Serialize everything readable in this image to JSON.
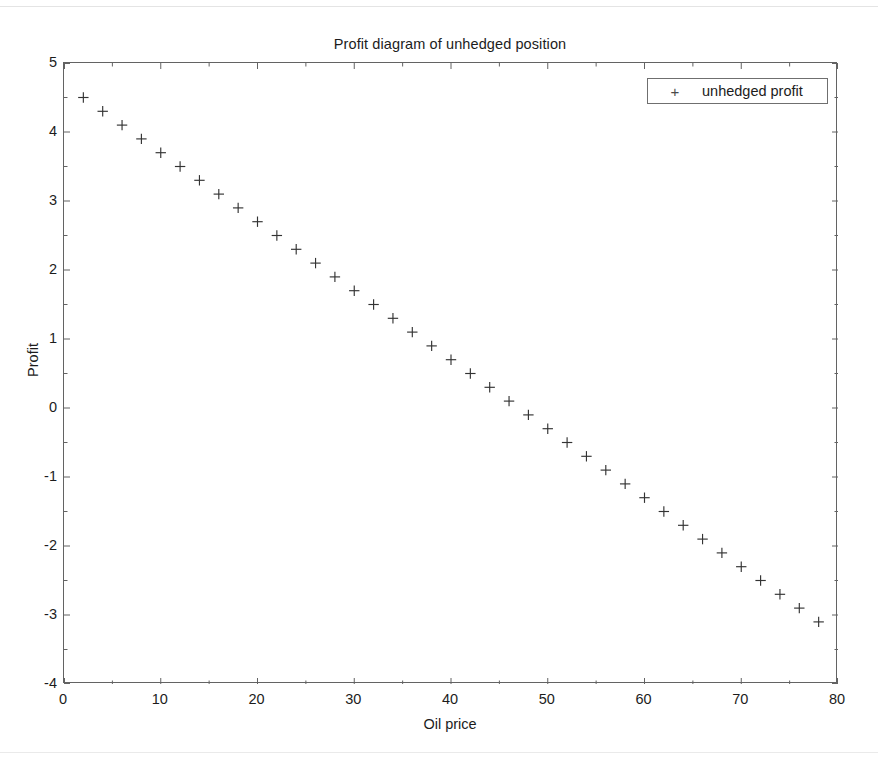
{
  "chart_data": {
    "type": "scatter",
    "title": "Profit diagram of unhedged position",
    "xlabel": "Oil price",
    "ylabel": "Profit",
    "xlim": [
      0,
      80
    ],
    "ylim": [
      -4,
      5
    ],
    "grid": false,
    "legend_position": "top-right",
    "marker": "+",
    "marker_color": "#333333",
    "series": [
      {
        "name": "unhedged profit",
        "marker": "+",
        "x": [
          2,
          4,
          6,
          8,
          10,
          12,
          14,
          16,
          18,
          20,
          22,
          24,
          26,
          28,
          30,
          32,
          34,
          36,
          38,
          40,
          42,
          44,
          46,
          48,
          50,
          52,
          54,
          56,
          58,
          60,
          62,
          64,
          66,
          68,
          70,
          72,
          74,
          76,
          78
        ],
        "values": [
          4.5,
          4.3,
          4.1,
          3.9,
          3.7,
          3.5,
          3.3,
          3.1,
          2.9,
          2.7,
          2.5,
          2.3,
          2.1,
          1.9,
          1.7,
          1.5,
          1.3,
          1.1,
          0.9,
          0.7,
          0.5,
          0.3,
          0.1,
          -0.1,
          -0.3,
          -0.5,
          -0.7,
          -0.9,
          -1.1,
          -1.3,
          -1.5,
          -1.7,
          -1.9,
          -2.1,
          -2.3,
          -2.5,
          -2.7,
          -2.9,
          -3.1
        ]
      }
    ],
    "xticks": [
      0,
      10,
      20,
      30,
      40,
      50,
      60,
      70,
      80
    ],
    "xtick_labels": [
      "0",
      "10",
      "20",
      "30",
      "40",
      "50",
      "60",
      "70",
      "80"
    ],
    "xminor_ticks": [
      5,
      15,
      25,
      35,
      45,
      55,
      65,
      75
    ],
    "yticks": [
      5,
      4,
      3,
      2,
      1,
      0,
      -1,
      -2,
      -3,
      -4
    ],
    "ytick_labels": [
      "5",
      "4",
      "3",
      "2",
      "1",
      "0",
      "-1",
      "-2",
      "-3",
      "-4"
    ],
    "yminor_ticks": [
      4.5,
      3.5,
      2.5,
      1.5,
      0.5,
      -0.5,
      -1.5,
      -2.5,
      -3.5
    ],
    "relationship": "profit = 4.7 - 0.1 * oil_price"
  },
  "legend": {
    "marker_glyph": "+",
    "entries": [
      {
        "label": "unhedged profit"
      }
    ]
  },
  "colors": {
    "axis": "#636363",
    "text": "#1c1c1c",
    "marker": "#333333",
    "background": "#ffffff"
  }
}
